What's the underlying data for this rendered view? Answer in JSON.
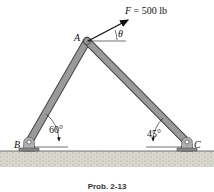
{
  "figure": {
    "caption": "Prob. 2-13",
    "force": {
      "symbol": "F",
      "equals": "= 500 lb",
      "angle_symbol": "θ"
    },
    "points": {
      "A": "A",
      "B": "B",
      "C": "C"
    },
    "angles": {
      "AB_member": "60°",
      "AC_member": "45°"
    },
    "colors": {
      "member": "#8a8a8a",
      "member_edge": "#444444",
      "ground": "#cfcfc4",
      "line": "#111111"
    }
  }
}
